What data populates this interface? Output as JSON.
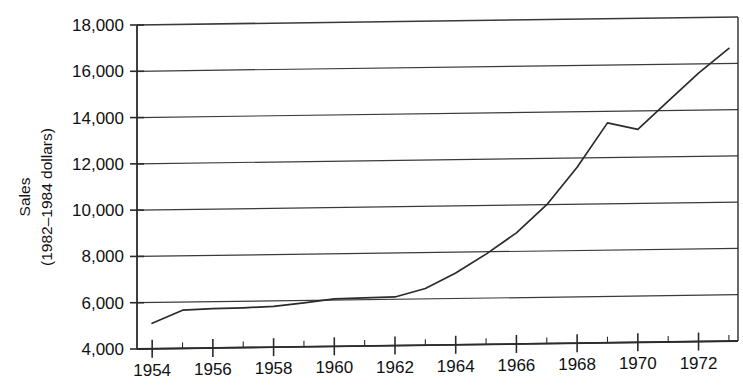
{
  "chart_data": {
    "type": "line",
    "title": "",
    "xlabel": "",
    "ylabel_line1": "Sales",
    "ylabel_line2": "(1982–1984 dollars)",
    "xlim": [
      1953.5,
      1973.3
    ],
    "ylim": [
      4000,
      18000
    ],
    "grid": true,
    "legend": "none",
    "x_tick_labels": [
      "1954",
      "1956",
      "1958",
      "1960",
      "1962",
      "1964",
      "1966",
      "1968",
      "1970",
      "1972"
    ],
    "x_ticks": [
      1954,
      1956,
      1958,
      1960,
      1962,
      1964,
      1966,
      1968,
      1970,
      1972
    ],
    "x_minor_ticks": [
      1955,
      1957,
      1959,
      1961,
      1963,
      1965,
      1967,
      1969,
      1971,
      1973
    ],
    "y_tick_labels": [
      "4,000",
      "6,000",
      "8,000",
      "10,000",
      "12,000",
      "14,000",
      "16,000",
      "18,000"
    ],
    "y_ticks": [
      4000,
      6000,
      8000,
      10000,
      12000,
      14000,
      16000,
      18000
    ],
    "x": [
      1954,
      1955,
      1956,
      1957,
      1958,
      1959,
      1960,
      1961,
      1962,
      1963,
      1964,
      1965,
      1966,
      1967,
      1968,
      1969,
      1970,
      1971,
      1972,
      1973
    ],
    "values": [
      5100,
      5650,
      5700,
      5720,
      5760,
      5900,
      6050,
      6080,
      6100,
      6450,
      7100,
      7900,
      8800,
      10000,
      11600,
      13500,
      13200,
      14400,
      15600,
      16650
    ],
    "series": [
      {
        "name": "Sales",
        "values": [
          5100,
          5650,
          5700,
          5720,
          5760,
          5900,
          6050,
          6080,
          6100,
          6450,
          7100,
          7900,
          8800,
          10000,
          11600,
          13500,
          13200,
          14400,
          15600,
          16650
        ]
      }
    ],
    "line_color": "#2b2b2b",
    "grid_color": "#3a3a3a",
    "axis_color": "#2b2b2b",
    "background": "#ffffff"
  }
}
